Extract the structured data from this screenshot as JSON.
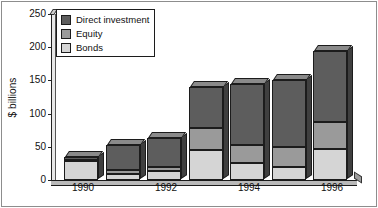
{
  "chart_data": {
    "type": "bar",
    "stacked": true,
    "title": "",
    "subtitle": "",
    "xlabel": "",
    "ylabel": "$ billions",
    "categories": [
      "1990",
      "1991",
      "1992",
      "1993",
      "1994",
      "1995",
      "1996"
    ],
    "tick_categories": [
      "1990",
      "1992",
      "1994",
      "1996"
    ],
    "series": [
      {
        "name": "Bonds",
        "values": [
          28,
          9,
          13,
          45,
          25,
          20,
          47
        ]
      },
      {
        "name": "Equity",
        "values": [
          2,
          6,
          7,
          34,
          28,
          30,
          41
        ]
      },
      {
        "name": "Direct investment",
        "values": [
          4,
          38,
          43,
          61,
          92,
          100,
          107
        ]
      }
    ],
    "totals": [
      34,
      53,
      63,
      140,
      145,
      150,
      195
    ],
    "ylim": [
      0,
      250
    ],
    "yticks": [
      0,
      50,
      100,
      150,
      200,
      250
    ],
    "ytick_labels": [
      "0",
      "50",
      "100",
      "150",
      "200",
      "250"
    ],
    "grid": false,
    "legend_position": "top-left",
    "colors": {
      "direct_investment": "#5d5d5d",
      "equity": "#9a9a9a",
      "bonds": "#d5d5d5",
      "axis": "#1c1c1c",
      "background": "#ffffff"
    }
  },
  "legend": {
    "items": [
      {
        "label": "Direct investment",
        "key": "direct"
      },
      {
        "label": "Equity",
        "key": "equity"
      },
      {
        "label": "Bonds",
        "key": "bonds"
      }
    ]
  },
  "axis": {
    "y_title": "$ billions",
    "y_labels": [
      "250",
      "200",
      "150",
      "100",
      "50",
      "0"
    ],
    "x_labels": [
      "1990",
      "1992",
      "1994",
      "1996"
    ]
  }
}
